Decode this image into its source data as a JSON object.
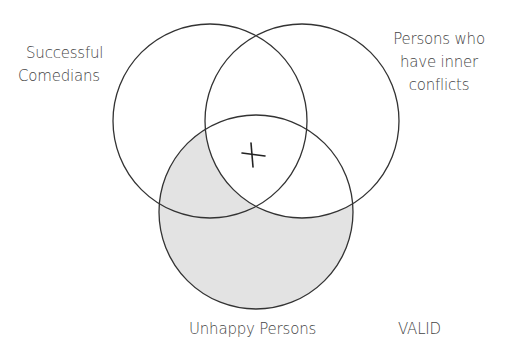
{
  "diagram": {
    "type": "venn",
    "verdict": "VALID",
    "sets": [
      {
        "id": "A",
        "label_lines": [
          "Successful",
          "Comedians"
        ],
        "cx": 210,
        "cy": 121,
        "r": 97
      },
      {
        "id": "B",
        "label_lines": [
          "Persons who",
          "have inner",
          "conflicts"
        ],
        "cx": 302,
        "cy": 121,
        "r": 97
      },
      {
        "id": "C",
        "label_lines": [
          "Unhappy Persons"
        ],
        "cx": 256,
        "cy": 212,
        "r": 97
      }
    ],
    "shaded_region": "C minus B",
    "marker": {
      "symbol": "X",
      "region": "A ∩ B ∩ C",
      "x": 253,
      "y": 155
    },
    "colors": {
      "stroke": "#333333",
      "shade": "#e3e3e3",
      "text": "#444444",
      "background": "#ffffff"
    }
  }
}
